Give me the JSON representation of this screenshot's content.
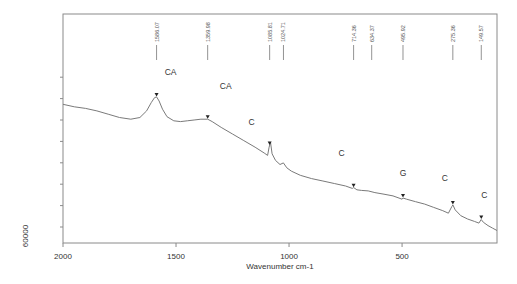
{
  "chart_data": {
    "type": "line",
    "title": "",
    "xlabel": "Wavenumber cm-1",
    "ylabel": "60000",
    "xlim": [
      2000,
      80
    ],
    "x_reversed": true,
    "x_ticks": [
      2000,
      1500,
      1000,
      500
    ],
    "x_tick_labels": [
      "2000",
      "1500",
      "1000",
      "500"
    ],
    "y_tick_count": 8,
    "grid": false,
    "legend": null,
    "peak_markers": [
      {
        "wavenumber": 1586.07,
        "label": "1586.07"
      },
      {
        "wavenumber": 1359.98,
        "label": "1359.98"
      },
      {
        "wavenumber": 1085.81,
        "label": "1085.81"
      },
      {
        "wavenumber": 1024.71,
        "label": "1024.71"
      },
      {
        "wavenumber": 714.36,
        "label": "714.36"
      },
      {
        "wavenumber": 634.37,
        "label": "634.37"
      },
      {
        "wavenumber": 495.92,
        "label": "495.92"
      },
      {
        "wavenumber": 275.36,
        "label": "275.36"
      },
      {
        "wavenumber": 149.57,
        "label": "149.57"
      }
    ],
    "annotations": [
      {
        "text": "CA",
        "wavenumber": 1586.07
      },
      {
        "text": "CA",
        "wavenumber": 1359.98
      },
      {
        "text": "C",
        "wavenumber": 1085.81
      },
      {
        "text": "C",
        "wavenumber": 714.36
      },
      {
        "text": "G",
        "wavenumber": 495.92
      },
      {
        "text": "C",
        "wavenumber": 275.36
      },
      {
        "text": "C",
        "wavenumber": 149.57
      }
    ],
    "series": [
      {
        "name": "Raman spectrum",
        "x": [
          2000,
          1950,
          1900,
          1850,
          1800,
          1750,
          1700,
          1660,
          1630,
          1610,
          1595,
          1586,
          1575,
          1560,
          1540,
          1510,
          1480,
          1450,
          1420,
          1390,
          1360,
          1340,
          1300,
          1250,
          1200,
          1150,
          1110,
          1095,
          1088,
          1082,
          1075,
          1060,
          1040,
          1025,
          1010,
          990,
          950,
          900,
          850,
          800,
          750,
          720,
          714,
          700,
          680,
          650,
          620,
          580,
          540,
          500,
          496,
          480,
          440,
          400,
          360,
          320,
          295,
          280,
          275,
          265,
          240,
          210,
          180,
          160,
          150,
          140,
          120,
          100,
          80
        ],
        "y_rel": [
          0.58,
          0.565,
          0.555,
          0.54,
          0.52,
          0.5,
          0.49,
          0.5,
          0.54,
          0.59,
          0.62,
          0.625,
          0.6,
          0.55,
          0.505,
          0.48,
          0.475,
          0.48,
          0.485,
          0.49,
          0.49,
          0.475,
          0.44,
          0.4,
          0.36,
          0.32,
          0.285,
          0.27,
          0.32,
          0.35,
          0.28,
          0.24,
          0.215,
          0.225,
          0.195,
          0.175,
          0.15,
          0.13,
          0.115,
          0.1,
          0.085,
          0.07,
          0.075,
          0.062,
          0.058,
          0.055,
          0.045,
          0.035,
          0.025,
          0.005,
          0.012,
          0.005,
          -0.01,
          -0.025,
          -0.045,
          -0.065,
          -0.08,
          -0.04,
          -0.03,
          -0.06,
          -0.095,
          -0.115,
          -0.13,
          -0.14,
          -0.118,
          -0.135,
          -0.155,
          -0.17,
          -0.185
        ]
      }
    ]
  }
}
